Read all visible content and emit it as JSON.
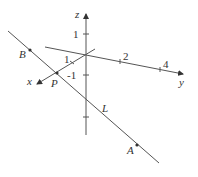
{
  "diagram": {
    "type": "3d-coordinate-axes-with-line",
    "colors": {
      "stroke": "#555555",
      "text": "#333333",
      "background": "#ffffff"
    },
    "axes": {
      "x": {
        "label": "x",
        "ticks": [
          {
            "label": "1"
          }
        ]
      },
      "y": {
        "label": "y",
        "ticks": [
          {
            "label": "2"
          },
          {
            "label": "4"
          }
        ]
      },
      "z": {
        "label": "z",
        "ticks": [
          {
            "label": "1"
          },
          {
            "label": "-1"
          }
        ]
      }
    },
    "line": {
      "label": "L"
    },
    "points": [
      {
        "label": "B"
      },
      {
        "label": "P"
      },
      {
        "label": "A"
      }
    ]
  }
}
